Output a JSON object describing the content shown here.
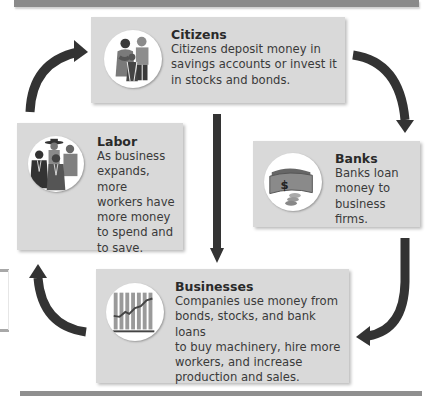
{
  "diagram": {
    "type": "cycle-flow",
    "nodes": [
      {
        "id": "citizens",
        "title": "Citizens",
        "description": "Citizens deposit money in savings accounts or invest it in stocks and bonds.",
        "lines": [
          "Citizens deposit money in",
          "savings accounts or invest it",
          "in stocks and bonds."
        ],
        "icon": "family-icon"
      },
      {
        "id": "banks",
        "title": "Banks",
        "description": "Banks loan money to business firms.",
        "lines": [
          "Banks loan",
          "money to",
          "business firms."
        ],
        "icon": "money-icon"
      },
      {
        "id": "businesses",
        "title": "Businesses",
        "description": "Companies use money from bonds, stocks, and bank loans to buy machinery, hire more workers, and increase production and sales.",
        "lines": [
          "Companies use money from",
          "bonds, stocks, and bank loans",
          "to buy machinery, hire more",
          "workers, and increase",
          "production and sales."
        ],
        "icon": "growth-chart-icon"
      },
      {
        "id": "labor",
        "title": "Labor",
        "description": "As business expands, more workers have more money to spend and to save.",
        "lines": [
          "As business",
          "expands, more",
          "workers have",
          "more money",
          "to spend and",
          "to save."
        ],
        "icon": "workers-icon"
      }
    ],
    "edges": [
      {
        "from": "citizens",
        "to": "banks",
        "style": "curved"
      },
      {
        "from": "banks",
        "to": "businesses",
        "style": "curved"
      },
      {
        "from": "businesses",
        "to": "labor",
        "style": "curved"
      },
      {
        "from": "labor",
        "to": "citizens",
        "style": "curved"
      },
      {
        "from": "citizens",
        "to": "businesses",
        "style": "straight"
      }
    ],
    "colors": {
      "box": "#d9d9d9",
      "arrow": "#333333",
      "bar": "#8a8a8a"
    }
  }
}
